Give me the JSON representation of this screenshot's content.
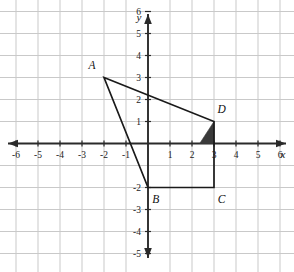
{
  "figure": {
    "title": "",
    "background_color": "#ffffff",
    "grid_color": "#c9c9c9",
    "axis_color": "#2a2a2a",
    "shape_color": "#1a1a1a",
    "shade_color": "#3a3a3a"
  },
  "axes": {
    "x_axis_label": "x",
    "y_axis_label": "y",
    "x_ticks": [
      -6,
      -5,
      -4,
      -3,
      -2,
      -1,
      1,
      2,
      3,
      4,
      5,
      6
    ],
    "x_tick_labels": [
      "-6",
      "-5",
      "-4",
      "-3",
      "-2",
      "-1",
      "1",
      "2",
      "3",
      "4",
      "5",
      "6"
    ],
    "y_ticks": [
      6,
      5,
      4,
      3,
      2,
      1,
      -2,
      -3,
      -4,
      -5
    ],
    "y_tick_labels": [
      "6",
      "5",
      "4",
      "3",
      "2",
      "1",
      "-2",
      "-3",
      "-4",
      "-5"
    ],
    "xlim": [
      -6.6,
      6.6
    ],
    "ylim": [
      -5.6,
      6.7
    ],
    "grid": true,
    "grid_step": 1,
    "x_arrow_both_ends": true,
    "y_arrow_both_ends": true
  },
  "chart_data": {
    "type": "scatter",
    "title": "",
    "xlabel": "x",
    "ylabel": "y",
    "xlim": [
      -6.6,
      6.6
    ],
    "ylim": [
      -5.6,
      6.7
    ],
    "grid": true,
    "legend": "none",
    "polygon": {
      "name": "ABCD",
      "closed": true,
      "vertices": [
        {
          "label": "A",
          "x": -2,
          "y": 3,
          "label_dx": -0.55,
          "label_dy": 0.55
        },
        {
          "label": "B",
          "x": 0,
          "y": -2,
          "label_dx": 0.35,
          "label_dy": -0.55
        },
        {
          "label": "C",
          "x": 3,
          "y": -2,
          "label_dx": 0.35,
          "label_dy": -0.55
        },
        {
          "label": "D",
          "x": 3,
          "y": 1,
          "label_dx": 0.35,
          "label_dy": 0.55
        }
      ]
    },
    "shaded_region": {
      "name": "shaded-triangle",
      "fill": "#3a3a3a",
      "vertices": [
        {
          "x": 3,
          "y": 1
        },
        {
          "x": 3,
          "y": 0
        },
        {
          "x": 2.35,
          "y": 0
        }
      ]
    }
  },
  "labels": {
    "point_a": "A",
    "point_b": "B",
    "point_c": "C",
    "point_d": "D"
  }
}
